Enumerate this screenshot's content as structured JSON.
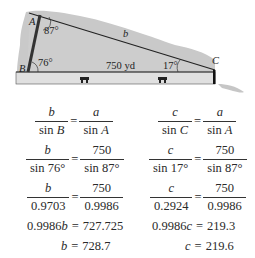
{
  "figure": {
    "vertex_labels": {
      "A": "A",
      "B": "B",
      "C": "C"
    },
    "side_label_b": "b",
    "base_label": "750 yd",
    "angle_A": "87°",
    "angle_B": "76°",
    "angle_C": "17°",
    "colors": {
      "fill": "#cfcfcf",
      "hill": "#c8c8c8",
      "road": "#dedede",
      "line": "#222222"
    }
  },
  "left_column": {
    "row1": {
      "lhs_num": "b",
      "lhs_den_fn": "sin ",
      "lhs_den_var": "B",
      "rhs_num": "a",
      "rhs_den_fn": "sin ",
      "rhs_den_var": "A"
    },
    "row2": {
      "lhs_num": "b",
      "lhs_den": "sin 76°",
      "rhs_num": "750",
      "rhs_den": "sin 87°"
    },
    "row3": {
      "lhs_num": "b",
      "lhs_den": "0.9703",
      "rhs_num": "750",
      "rhs_den": "0.9986"
    },
    "row4": {
      "lhs_coef": "0.9986",
      "lhs_var": "b",
      "rhs": "727.725"
    },
    "row5": {
      "lhs_var": "b",
      "rhs": "728.7"
    }
  },
  "right_column": {
    "row1": {
      "lhs_num": "c",
      "lhs_den_fn": "sin ",
      "lhs_den_var": "C",
      "rhs_num": "a",
      "rhs_den_fn": "sin ",
      "rhs_den_var": "A"
    },
    "row2": {
      "lhs_num": "c",
      "lhs_den": "sin 17°",
      "rhs_num": "750",
      "rhs_den": "sin 87°"
    },
    "row3": {
      "lhs_num": "c",
      "lhs_den": "0.2924",
      "rhs_num": "750",
      "rhs_den": "0.9986"
    },
    "row4": {
      "lhs_coef": "0.9986",
      "lhs_var": "c",
      "rhs": "219.3"
    },
    "row5": {
      "lhs_var": "c",
      "rhs": "219.6"
    }
  },
  "equals": "="
}
